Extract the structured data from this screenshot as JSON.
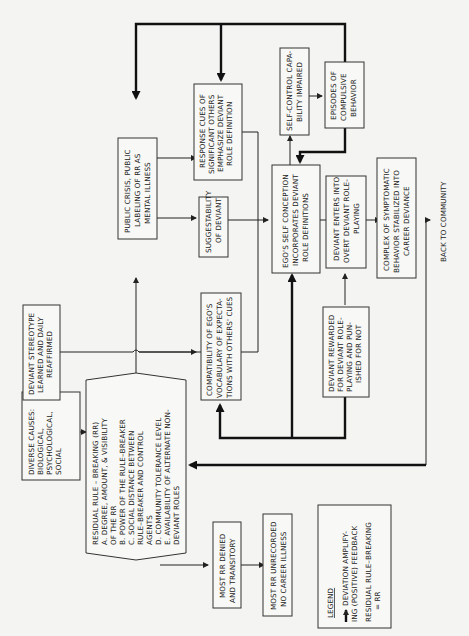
{
  "diagram": {
    "orientation": "rotated-90-ccw",
    "nodes": {
      "diverse_causes": {
        "lines": [
          "DIVERSE CAUSES:",
          "BIOLOGICAL,",
          "PSYCHOLOGICAL,",
          "SOCIAL"
        ]
      },
      "deviant_stereotype": {
        "lines": [
          "DEVIANT STEREOTYPE",
          "LEARNED AND DAILY",
          "REAFFIRMED"
        ]
      },
      "residual_rule": {
        "lines": [
          "RESIDUAL RULE – BREAKING (RR)",
          "A.   DEGREE, AMOUNT, & VISIBILITY",
          "      OF THE RR",
          "B.   POWER OF THE RULE–BREAKER",
          "C.   SOCIAL DISTANCE BETWEEN",
          "      RULE–BREAKER AND CONTROL",
          "      AGENTS",
          "D.   COMMUNITY TOLERANCE LEVEL",
          "E.   AVAILABILITY OF ALTERNATE NON-",
          "      DEVIANT ROLES"
        ]
      },
      "most_rr_denied": {
        "lines": [
          "MOST RR DENIED",
          "AND TRANSITORY"
        ]
      },
      "most_rr_unrecorded": {
        "lines": [
          "MOST RR UNRECORDED",
          "NO CAREER ILLNESS"
        ]
      },
      "public_crisis": {
        "lines": [
          "PUBLIC CRISIS, PUBLIC",
          "LABELING OF RR AS",
          "MENTAL ILLNESS"
        ]
      },
      "response_cues": {
        "lines": [
          "RESPONSE CUES OF",
          "SIGNIFICANT OTHERS",
          "EMPHASIZE DEVIANT",
          "ROLE DEFINITION"
        ]
      },
      "suggestability": {
        "lines": [
          "SUGGESTABILITY",
          "OF DEVIANT"
        ]
      },
      "compatibility": {
        "lines": [
          "COMPATIBILITY OF EGO'S",
          "VOCABULARY OF EXPECTA-",
          "TIONS WITH OTHERS' CUES"
        ]
      },
      "self_control": {
        "lines": [
          "SELF-CONTROL CAPA-",
          "BILITY IMPAIRED"
        ]
      },
      "episodes": {
        "lines": [
          "EPISODES OF",
          "COMPULSIVE",
          "BEHAVIOR"
        ]
      },
      "ego_self_conception": {
        "lines": [
          "EGO'S SELF CONCEPTION",
          "INCORPORATES DEVIANT",
          "ROLE DEFINITIONS"
        ]
      },
      "deviant_enters": {
        "lines": [
          "DEVIANT ENTERS INTO",
          "OVERT DEVIANT ROLE-",
          "PLAYING"
        ]
      },
      "deviant_rewarded": {
        "lines": [
          "DEVIANT REWARDED",
          "FOR DEVIANT ROLE-",
          "PLAYING AND PUN-",
          "ISHED FOR NOT"
        ]
      },
      "complex_symptomatic": {
        "lines": [
          "COMPLEX OF SYMPTOMATIC",
          "BEHAVIOR STABILIZED INTO",
          "CAREER DEVIANCE"
        ]
      }
    },
    "back_to_community": "BACK TO COMMUNITY",
    "legend": {
      "title": "LEGEND",
      "arrow_lines": [
        "DEVIATION AMPLIFY-",
        "ING (POSITIVE) FEEDBACK"
      ],
      "abbrev_lines": [
        "RESIDUAL RULE–BREAKING",
        "= RR"
      ]
    }
  }
}
